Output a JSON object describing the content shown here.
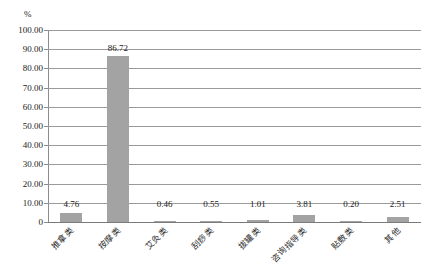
{
  "chart_data": {
    "type": "bar",
    "title": "",
    "subtitle": "",
    "xlabel": "",
    "ylabel": "%",
    "unit_label": "%",
    "categories": [
      "推拿类",
      "按摩类",
      "艾灸类",
      "刮痧类",
      "拔罐类",
      "咨询指导类",
      "贴敷类",
      "其他"
    ],
    "values": [
      4.76,
      86.72,
      0.46,
      0.55,
      1.01,
      3.81,
      0.2,
      2.51
    ],
    "value_labels": [
      "4.76",
      "86.72",
      "0.46",
      "0.55",
      "1.01",
      "3.81",
      "0.20",
      "2.51"
    ],
    "ylim": [
      0,
      100
    ],
    "ytick_values": [
      100,
      90,
      80,
      70,
      60,
      50,
      40,
      30,
      20,
      10,
      0
    ],
    "ytick_labels": [
      "100.00",
      "90.00",
      "80.00",
      "70.00",
      "60.00",
      "50.00",
      "40.00",
      "30.00",
      "20.00",
      "10.00",
      "0"
    ],
    "grid": true,
    "grid_axis": "y",
    "legend": false,
    "legend_position": "none",
    "bar_color": "#a3a3a3",
    "grid_color": "#9a9a9a",
    "axis_color": "#8c8c8c",
    "background_color": "#ffffff",
    "xtick_label_rotation": -45
  }
}
